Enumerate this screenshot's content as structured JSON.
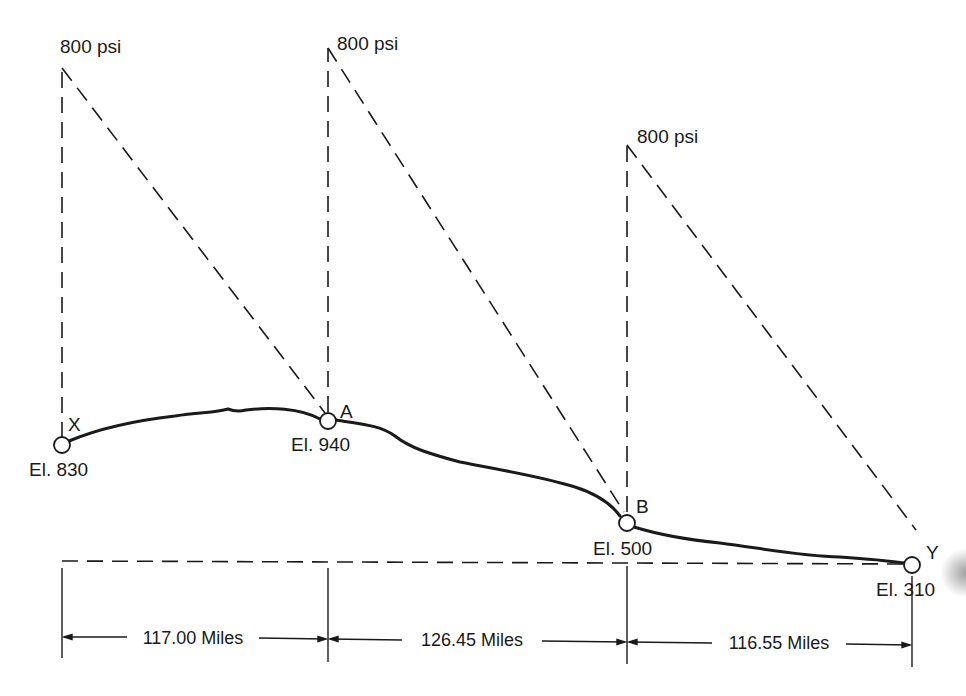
{
  "diagram": {
    "type": "pipeline hydraulic gradient profile",
    "stations": [
      {
        "id": "X",
        "label": "X",
        "elevation_label": "El. 830",
        "pressure_label": "800 psi"
      },
      {
        "id": "A",
        "label": "A",
        "elevation_label": "El. 940",
        "pressure_label": "800 psi"
      },
      {
        "id": "B",
        "label": "B",
        "elevation_label": "El. 500",
        "pressure_label": "800 psi"
      },
      {
        "id": "Y",
        "label": "Y",
        "elevation_label": "El. 310"
      }
    ],
    "segments": [
      {
        "from": "X",
        "to": "A",
        "distance_label": "117.00 Miles"
      },
      {
        "from": "A",
        "to": "B",
        "distance_label": "126.45 Miles"
      },
      {
        "from": "B",
        "to": "Y",
        "distance_label": "116.55 Miles"
      }
    ],
    "colors": {
      "line": "#1a1a1a",
      "background": "#ffffff"
    }
  }
}
